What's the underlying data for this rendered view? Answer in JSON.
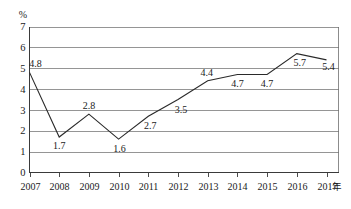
{
  "chart_data": {
    "type": "line",
    "title": "",
    "subtitle": "",
    "xlabel": "年",
    "ylabel": "%",
    "categories": [
      "2007",
      "2008",
      "2009",
      "2010",
      "2011",
      "2012",
      "2013",
      "2014",
      "2015",
      "2016",
      "2017"
    ],
    "values": [
      4.8,
      1.7,
      2.8,
      1.6,
      2.7,
      3.5,
      4.4,
      4.7,
      4.7,
      5.7,
      5.4
    ],
    "series": [
      {
        "name": "",
        "values": [
          4.8,
          1.7,
          2.8,
          1.6,
          2.7,
          3.5,
          4.4,
          4.7,
          4.7,
          5.7,
          5.4
        ]
      }
    ],
    "point_labels": [
      "4.8",
      "1.7",
      "2.8",
      "1.6",
      "2.7",
      "3.5",
      "4.4",
      "4.7",
      "4.7",
      "5.7",
      "5.4"
    ],
    "ylim": [
      0,
      7
    ],
    "yticks": [
      "0",
      "1",
      "2",
      "3",
      "4",
      "5",
      "6",
      "7"
    ],
    "ytick_values": [
      0,
      1,
      2,
      3,
      4,
      5,
      6,
      7
    ],
    "grid": true,
    "grid_axis": "y",
    "legend": false,
    "legend_position": "none",
    "marker": "none",
    "colors": {
      "line": "#2a2a2a",
      "grid": "#7a7a7a",
      "axis": "#3a3a3a",
      "background": "#ffffff",
      "text": "#1a1a1a"
    }
  },
  "axis": {
    "unit_label": "%",
    "x_suffix_label": "年"
  }
}
